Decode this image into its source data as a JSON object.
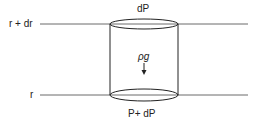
{
  "diagram": {
    "type": "fluid-element-cylinder",
    "labels": {
      "upper_level": "r + dr",
      "lower_level": "r",
      "top_face": "dP",
      "body_force": "ρg",
      "bottom_face": "P+ dP"
    },
    "arrow_direction": "down",
    "stroke_color": "#222222",
    "background": "#ffffff"
  }
}
